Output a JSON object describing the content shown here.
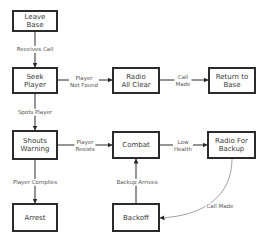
{
  "diagram": {
    "type": "flowchart",
    "nodes": {
      "leave_base": {
        "label": "Leave Base"
      },
      "seek_player": {
        "label": "Seek\nPlayer"
      },
      "radio_all_clear": {
        "label": "Radio\nAll Clear"
      },
      "return_to_base": {
        "label": "Return to\nBase"
      },
      "shouts_warning": {
        "label": "Shouts\nWarning"
      },
      "combat": {
        "label": "Combat"
      },
      "radio_for_backup": {
        "label": "Radio For\nBackup"
      },
      "arrest": {
        "label": "Arrest"
      },
      "backoff": {
        "label": "Backoff"
      }
    },
    "edges": {
      "receives_call": {
        "from": "Leave Base",
        "to": "Seek Player",
        "label": "Receives Call"
      },
      "player_not_found": {
        "from": "Seek Player",
        "to": "Radio All Clear",
        "label": "Player\nNot Found"
      },
      "call_made_top": {
        "from": "Radio All Clear",
        "to": "Return to Base",
        "label": "Call\nMade"
      },
      "spots_player": {
        "from": "Seek Player",
        "to": "Shouts Warning",
        "label": "Spots Player"
      },
      "player_resists": {
        "from": "Shouts Warning",
        "to": "Combat",
        "label": "Player\nResists"
      },
      "low_health": {
        "from": "Combat",
        "to": "Radio For Backup",
        "label": "Low\nHealth"
      },
      "player_complies": {
        "from": "Shouts Warning",
        "to": "Arrest",
        "label": "Player Complies"
      },
      "backup_arrives": {
        "from": "Backoff",
        "to": "Combat",
        "label": "Backup Arrives"
      },
      "call_made_bottom": {
        "from": "Radio For Backup",
        "to": "Backoff",
        "label": "Call Made"
      }
    }
  },
  "colors": {
    "stroke": "#2b2b2b",
    "text": "#3a3a3a",
    "edge_label": "#555555",
    "background": "#ffffff"
  }
}
